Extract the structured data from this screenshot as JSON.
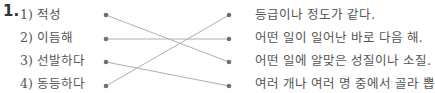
{
  "question": {
    "number": "1.",
    "left_items": [
      {
        "label": "1) 적성"
      },
      {
        "label": "2) 이듬해"
      },
      {
        "label": "3) 선발하다"
      },
      {
        "label": "4) 동등하다"
      }
    ],
    "right_items": [
      {
        "label": "등급이나 정도가 같다."
      },
      {
        "label": "어떤 일이 일어난 바로 다음 해."
      },
      {
        "label": "어떤 일에 알맞은 성질이나 소질."
      },
      {
        "label": "여러 개나 여러 명 중에서 골라 뽑"
      }
    ],
    "connections": [
      {
        "from": 1,
        "to": 3
      },
      {
        "from": 2,
        "to": 2
      },
      {
        "from": 3,
        "to": 4
      },
      {
        "from": 4,
        "to": 1
      }
    ],
    "colors": {
      "line": "#b0b0b0",
      "dot": "#707070",
      "text": "#555555"
    }
  }
}
